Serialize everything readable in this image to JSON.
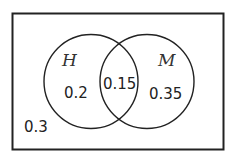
{
  "diagram": {
    "type": "venn",
    "colors": {
      "stroke": "#222222",
      "background": "#ffffff",
      "text": "#222222"
    },
    "universe": {
      "outside_value": "0.3"
    },
    "sets": [
      {
        "label": "H",
        "only_value": "0.2"
      },
      {
        "label": "M",
        "only_value": "0.35"
      }
    ],
    "intersection_value": "0.15"
  }
}
